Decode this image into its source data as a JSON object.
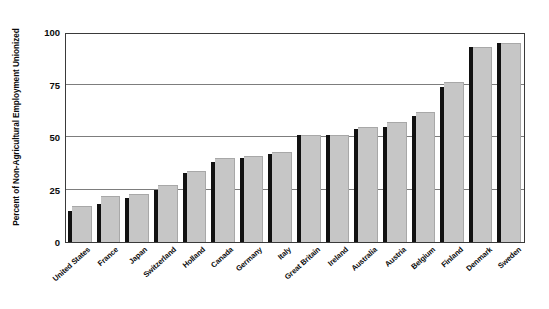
{
  "chart_data": {
    "type": "bar",
    "title": "",
    "subtitle": "",
    "xlabel": "",
    "ylabel": "Percent of Non-Agricultural Employment Unionized",
    "ylim": [
      0,
      100
    ],
    "yticks": [
      0,
      25,
      50,
      75,
      100
    ],
    "ytick_labels": [
      "0",
      "25",
      "50",
      "75",
      "100"
    ],
    "grid": true,
    "legend": "none",
    "legend_entries": [],
    "annotations": [],
    "categories": [
      "United States",
      "France",
      "Japan",
      "Switzerland",
      "Holland",
      "Canada",
      "Germany",
      "Italy",
      "Great Britain",
      "Ireland",
      "Australia",
      "Austria",
      "Belgium",
      "Finland",
      "Denmark",
      "Sweden"
    ],
    "series": [
      {
        "name": "marker",
        "color": "#111111",
        "values": [
          15,
          18,
          21,
          25,
          33,
          38,
          40,
          42,
          51,
          51,
          54,
          55,
          60,
          74,
          93,
          95
        ]
      },
      {
        "name": "value",
        "color": "#c6c6c6",
        "values": [
          17,
          22,
          23,
          27,
          34,
          40,
          41,
          43,
          51,
          51,
          55,
          57,
          62,
          76,
          93,
          95
        ]
      }
    ]
  },
  "axis": {
    "y_title": "Percent of Non-Agricultural Employment Unionized"
  },
  "colors": {
    "bar_dark": "#111111",
    "bar_light": "#c6c6c6",
    "gridline": "#7d7d7d",
    "frame": "#3a3a3a",
    "text": "#0b0b0b",
    "background": "#ffffff"
  }
}
